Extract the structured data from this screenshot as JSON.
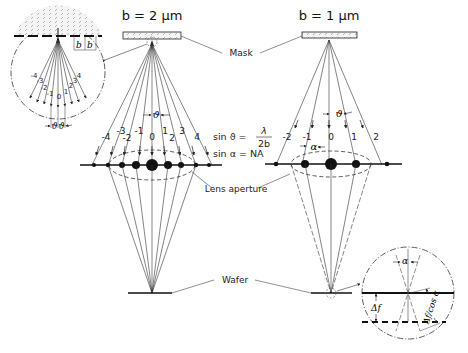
{
  "diagram": {
    "left_setup": {
      "title": "b = 2 µm",
      "orders": [
        "-4",
        "-3",
        "-2",
        "-1",
        "0",
        "1",
        "2",
        "3",
        "4"
      ],
      "angle_label": "ϑ"
    },
    "right_setup": {
      "title": "b = 1 µm",
      "orders": [
        "-2",
        "-1",
        "0",
        "1",
        "2"
      ],
      "angle_label": "ϑ",
      "aperture_angle_label": "α"
    },
    "labels": {
      "mask": "Mask",
      "lens_aperture": "Lens aperture",
      "wafer": "Wafer"
    },
    "equations": {
      "sin_theta_lhs": "sin ϑ =",
      "sin_theta_num": "λ",
      "sin_theta_den": "2b",
      "sin_alpha": "sin α = NA"
    },
    "mask_detail_inset": {
      "period_labels": [
        "b",
        "b"
      ],
      "orders": [
        "-4",
        "-3",
        "-2",
        "-1",
        "0",
        "1",
        "2",
        "3",
        "4"
      ],
      "angle_labels": [
        "ϑ",
        "ϑ"
      ]
    },
    "wafer_detail_inset": {
      "alpha_label": "α",
      "defocus_label": "Δf",
      "path_label": "Δf/cos α"
    },
    "colors": {
      "line": "#222222",
      "dashed": "#333333",
      "background": "#ffffff"
    }
  }
}
